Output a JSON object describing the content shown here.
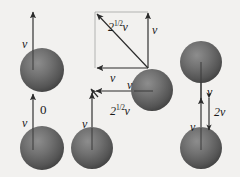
{
  "figure": {
    "type": "physics-vector-diagram",
    "background_color": "#f2f1ef",
    "sphere_color_light": "#8f8f8f",
    "sphere_color_dark": "#4a4a4a",
    "arrow_color": "#2b2b2b"
  },
  "labels": {
    "left_top_v": "v",
    "left_bottom_v": "v",
    "left_relative": "0",
    "triangle_diagonal": "2",
    "triangle_diagonal_exp": "1/2",
    "triangle_diagonal_var": "v",
    "triangle_right_v": "v",
    "triangle_bottom_v": "v",
    "mid_bottom_v": "v",
    "mid_right_v": "v",
    "mid_diagonal": "2",
    "mid_diagonal_exp": "1/2",
    "mid_diagonal_var": "v",
    "right_top_v": "v",
    "right_bottom_v": "v",
    "right_relative": "2v"
  },
  "spheres": [
    {
      "name": "left-upper-sphere",
      "cx": 42,
      "cy": 70,
      "r": 22
    },
    {
      "name": "left-lower-sphere",
      "cx": 42,
      "cy": 148,
      "r": 22
    },
    {
      "name": "mid-right-sphere",
      "cx": 152,
      "cy": 90,
      "r": 21
    },
    {
      "name": "mid-lower-sphere",
      "cx": 92,
      "cy": 148,
      "r": 21
    },
    {
      "name": "right-upper-sphere",
      "cx": 201,
      "cy": 62,
      "r": 21
    },
    {
      "name": "right-lower-sphere",
      "cx": 201,
      "cy": 148,
      "r": 21
    }
  ],
  "vectors": [
    {
      "name": "left-upper-velocity-arrow",
      "x1": 33,
      "y1": 72,
      "x2": 33,
      "y2": 10
    },
    {
      "name": "left-lower-velocity-arrow",
      "x1": 33,
      "y1": 150,
      "x2": 33,
      "y2": 92
    },
    {
      "name": "triangle-diagonal-arrow",
      "x1": 148,
      "y1": 68,
      "x2": 95,
      "y2": 12
    },
    {
      "name": "triangle-right-arrow",
      "x1": 148,
      "y1": 68,
      "x2": 148,
      "y2": 11
    },
    {
      "name": "triangle-bottom-arrow",
      "x1": 148,
      "y1": 68,
      "x2": 95,
      "y2": 68
    },
    {
      "name": "mid-lower-velocity-arrow",
      "x1": 92,
      "y1": 150,
      "x2": 92,
      "y2": 91
    },
    {
      "name": "mid-right-velocity-arrow",
      "x1": 153,
      "y1": 91,
      "x2": 94,
      "y2": 91
    },
    {
      "name": "mid-diagonal-arrowhead",
      "x1": 99,
      "y1": 97,
      "x2": 90,
      "y2": 88
    },
    {
      "name": "right-upper-velocity-arrow",
      "x1": 201,
      "y1": 100,
      "x2": 201,
      "y2": 44
    },
    {
      "name": "right-lower-velocity-arrow",
      "x1": 201,
      "y1": 150,
      "x2": 201,
      "y2": 96
    },
    {
      "name": "right-relative-arrow",
      "x1": 209,
      "y1": 95,
      "x2": 209,
      "y2": 133
    }
  ]
}
